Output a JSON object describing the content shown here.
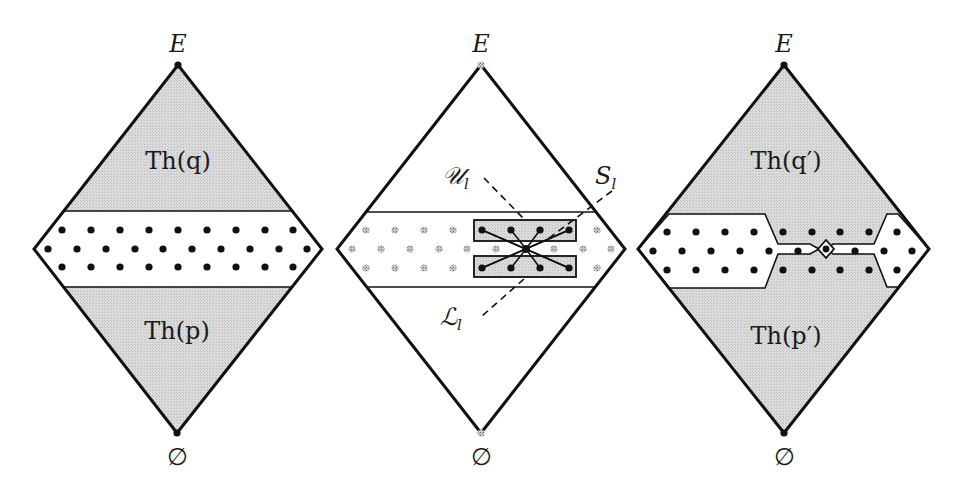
{
  "colors": {
    "background": "#ffffff",
    "stroke": "#111111",
    "shade": "#d6d6d6",
    "dot": "#111111",
    "gray_dot": "#9a9a9a"
  },
  "panels": [
    {
      "id": "left",
      "top_label": "E",
      "bottom_label": "∅",
      "upper_region_label": "Th(q)",
      "lower_region_label": "Th(p)"
    },
    {
      "id": "middle",
      "top_label": "E",
      "bottom_label": "∅",
      "annotations": {
        "upper_set": "𝒰",
        "upper_set_sub": "l",
        "lower_set": "ℒ",
        "lower_set_sub": "l",
        "separator": "S",
        "separator_sub": "l"
      }
    },
    {
      "id": "right",
      "top_label": "E",
      "bottom_label": "∅",
      "upper_region_label": "Th(q′)",
      "lower_region_label": "Th(p′)"
    }
  ]
}
